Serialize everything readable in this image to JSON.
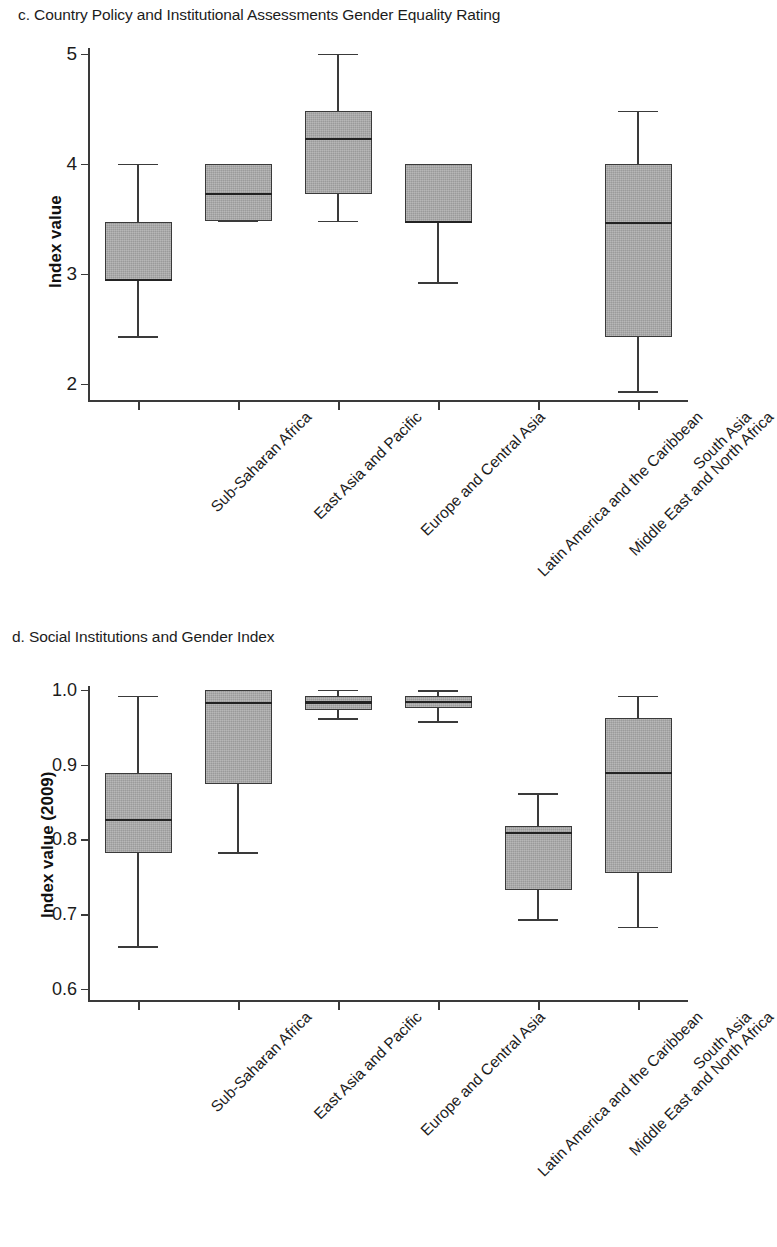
{
  "figure": {
    "panels": [
      {
        "key": "c",
        "title": "c. Country Policy and Institutional Assessments Gender Equality Rating"
      },
      {
        "key": "d",
        "title": "d. Social Institutions and Gender Index"
      }
    ]
  },
  "chart_data": [
    {
      "type": "box",
      "panel_label": "c",
      "title": "c. Country Policy and Institutional Assessments Gender Equality Rating",
      "xlabel": "",
      "ylabel": "Index value",
      "ylim": [
        1.85,
        5.05
      ],
      "yticks": [
        2,
        3,
        4,
        5
      ],
      "ytick_labels": [
        "2",
        "3",
        "4",
        "5"
      ],
      "grid": false,
      "legend": null,
      "categories": [
        "Sub-Saharan Africa",
        "East Asia and Pacific",
        "Europe and Central Asia",
        "Latin America and the Caribbean",
        "Middle East and North Africa",
        "South Asia"
      ],
      "boxes": [
        {
          "category": "Sub-Saharan Africa",
          "whisker_low": 2.43,
          "q1": 2.94,
          "median": 2.94,
          "q3": 3.47,
          "whisker_high": 4.0
        },
        {
          "category": "East Asia and Pacific",
          "whisker_low": 3.48,
          "q1": 3.48,
          "median": 3.72,
          "q3": 4.0,
          "whisker_high": 4.0
        },
        {
          "category": "Europe and Central Asia",
          "whisker_low": 3.48,
          "q1": 3.72,
          "median": 4.22,
          "q3": 4.48,
          "whisker_high": 5.0
        },
        {
          "category": "Latin America and the Caribbean",
          "whisker_low": 2.92,
          "q1": 3.47,
          "median": 3.47,
          "q3": 4.0,
          "whisker_high": 4.0
        },
        {
          "category": "Middle East and North Africa",
          "whisker_low": null,
          "q1": null,
          "median": null,
          "q3": null,
          "whisker_high": null
        },
        {
          "category": "South Asia",
          "whisker_low": 1.93,
          "q1": 2.42,
          "median": 3.46,
          "q3": 4.0,
          "whisker_high": 4.48
        }
      ]
    },
    {
      "type": "box",
      "panel_label": "d",
      "title": "d. Social Institutions and Gender Index",
      "xlabel": "",
      "ylabel": "Index value (2009)",
      "ylim": [
        0.585,
        1.005
      ],
      "yticks": [
        0.6,
        0.7,
        0.8,
        0.9,
        1.0
      ],
      "ytick_labels": [
        "0.6",
        "0.7",
        "0.8",
        "0.9",
        "1.0"
      ],
      "grid": false,
      "legend": null,
      "categories": [
        "Sub-Saharan Africa",
        "East Asia and Pacific",
        "Europe and Central Asia",
        "Latin America and the Caribbean",
        "Middle East and North Africa",
        "South Asia"
      ],
      "boxes": [
        {
          "category": "Sub-Saharan Africa",
          "whisker_low": 0.657,
          "q1": 0.781,
          "median": 0.826,
          "q3": 0.888,
          "whisker_high": 0.992
        },
        {
          "category": "East Asia and Pacific",
          "whisker_low": 0.783,
          "q1": 0.874,
          "median": 0.982,
          "q3": 0.999,
          "whisker_high": 0.999
        },
        {
          "category": "Europe and Central Asia",
          "whisker_low": 0.962,
          "q1": 0.973,
          "median": 0.983,
          "q3": 0.991,
          "whisker_high": 1.0
        },
        {
          "category": "Latin America and the Caribbean",
          "whisker_low": 0.958,
          "q1": 0.975,
          "median": 0.984,
          "q3": 0.992,
          "whisker_high": 0.999
        },
        {
          "category": "Middle East and North Africa",
          "whisker_low": 0.693,
          "q1": 0.732,
          "median": 0.808,
          "q3": 0.818,
          "whisker_high": 0.862
        },
        {
          "category": "South Asia",
          "whisker_low": 0.683,
          "q1": 0.755,
          "median": 0.889,
          "q3": 0.962,
          "whisker_high": 0.992
        }
      ]
    }
  ],
  "style": {
    "box_fill": "#a9a9a9",
    "box_stroke": "#3a3a3a",
    "median_color": "#232323",
    "text_color": "#1c1c1c",
    "background": "#ffffff"
  }
}
